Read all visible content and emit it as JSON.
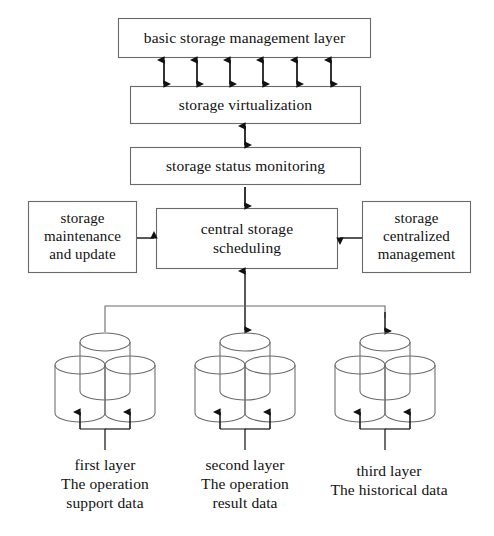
{
  "diagram": {
    "stroke_color": "#3b3b3b",
    "fill_color": "#ffffff",
    "text_color": "#111111",
    "background": "#ffffff"
  },
  "boxes": {
    "basic_storage_management_layer": "basic storage management  layer",
    "storage_virtualization": "storage virtualization",
    "storage_status_monitoring": "storage  status  monitoring",
    "storage_maintenance_and_update": "storage\nmaintenance\nand update",
    "central_storage_scheduling": "central storage\nscheduling",
    "storage_centralized_management": "storage\ncentralized\nmanagement"
  },
  "box_lines": {
    "maintenance": [
      "storage",
      "maintenance",
      "and update"
    ],
    "central": [
      "central storage",
      "scheduling"
    ],
    "centralized": [
      "storage",
      "centralized",
      "management"
    ]
  },
  "storage_layers": [
    {
      "id": "first-layer",
      "lines": [
        "first layer",
        "The operation",
        "support data"
      ],
      "name_line": "first layer",
      "desc_line_1": "The operation",
      "desc_line_2": "support data"
    },
    {
      "id": "second-layer",
      "lines": [
        "second layer",
        "The operation",
        "result data"
      ],
      "name_line": "second layer",
      "desc_line_1": "The operation",
      "desc_line_2": "result data"
    },
    {
      "id": "third-layer",
      "lines": [
        "third layer",
        "The historical data"
      ],
      "name_line": "third layer",
      "desc_line_1": "The historical data",
      "desc_line_2": ""
    }
  ],
  "connectors": {
    "management_to_virtualization": "six bidirectional vertical arrows",
    "virtualization_to_monitoring": "bidirectional vertical arrow",
    "monitoring_to_central": "downward arrow",
    "maintenance_to_central": "rightward arrow",
    "centralized_to_central": "leftward arrow",
    "central_to_storage_bus": "bidirectional vertical arrow to distribution bus",
    "bus_to_layer_one": "plain line",
    "bus_to_layer_two": "downward arrow",
    "bus_to_layer_three": "downward arrow",
    "layer_inputs": "two upward arrows into each cylinder pair"
  }
}
